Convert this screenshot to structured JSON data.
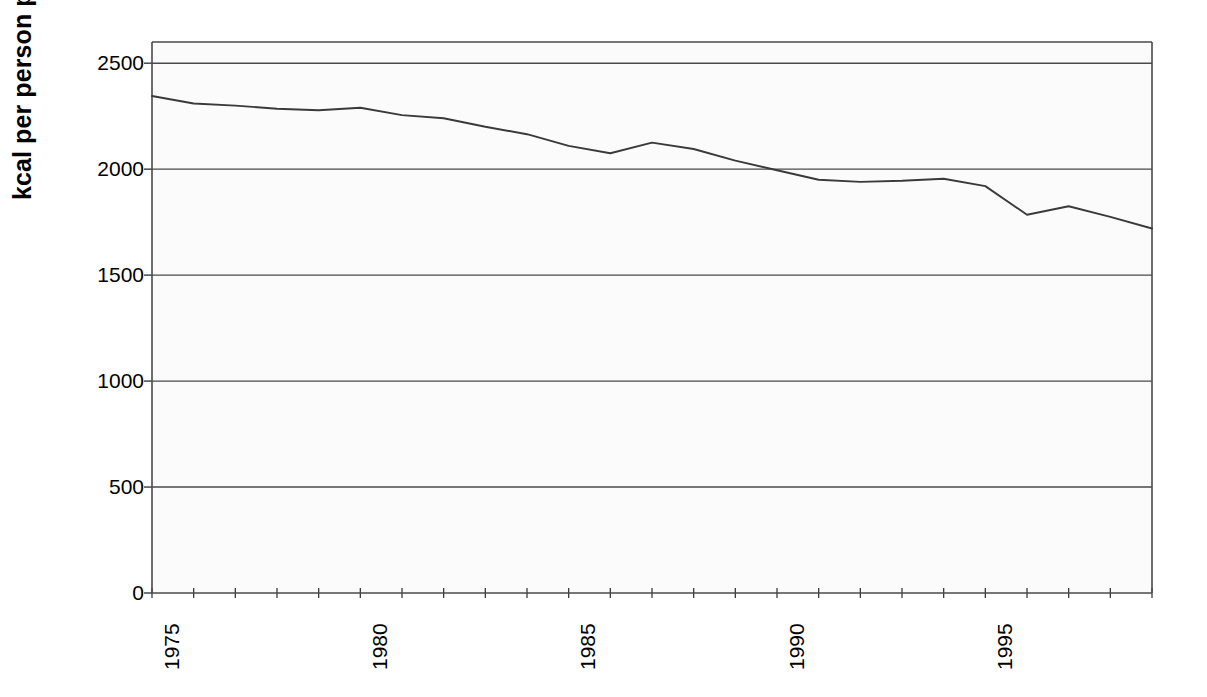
{
  "chart_data": {
    "type": "line",
    "title": "",
    "xlabel": "",
    "ylabel": "kcal per person per day",
    "xlim": [
      1974,
      1998
    ],
    "ylim": [
      0,
      2600
    ],
    "grid": true,
    "grid_axis": "y",
    "legend": "none",
    "y_ticks": [
      0,
      500,
      1000,
      1500,
      2000,
      2500
    ],
    "y_tick_labels": [
      "0",
      "500",
      "1000",
      "1500",
      "2000",
      "2500"
    ],
    "x_ticks": [
      1975,
      1980,
      1985,
      1990,
      1995
    ],
    "x_tick_labels": [
      "1975",
      "1980",
      "1985",
      "1990",
      "1995"
    ],
    "x_minor_tick_interval": 1,
    "line_color": "#3a3a3a",
    "plot_background": "#fbfbfb",
    "series": [
      {
        "name": "kcal per person per day",
        "x": [
          1974,
          1975,
          1976,
          1977,
          1978,
          1979,
          1980,
          1981,
          1982,
          1983,
          1984,
          1985,
          1986,
          1987,
          1988,
          1989,
          1990,
          1991,
          1992,
          1993,
          1994,
          1995,
          1996,
          1997,
          1998
        ],
        "values": [
          2345,
          2310,
          2300,
          2285,
          2278,
          2290,
          2255,
          2240,
          2200,
          2165,
          2110,
          2075,
          2125,
          2095,
          2040,
          1995,
          1950,
          1940,
          1945,
          1955,
          1920,
          1785,
          1825,
          1775,
          1720
        ]
      }
    ]
  },
  "axes": {
    "ylabel_text": "kcal per person per day"
  }
}
